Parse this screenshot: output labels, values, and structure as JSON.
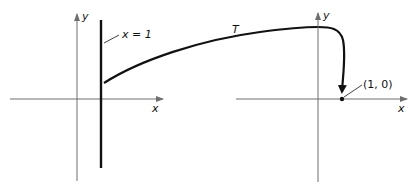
{
  "diagram": {
    "left_plane": {
      "x_axis_label": "x",
      "y_axis_label": "y",
      "line_label": "x = 1"
    },
    "right_plane": {
      "x_axis_label": "x",
      "y_axis_label": "y",
      "point_label": "(1, 0)"
    },
    "curve_label": "T",
    "colors": {
      "axis": "#6e6e6e",
      "ink": "#111111",
      "background": "#ffffff"
    }
  }
}
